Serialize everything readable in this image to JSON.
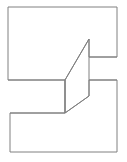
{
  "figure": {
    "canvas": {
      "width": 127,
      "height": 162,
      "background_color": "#ffffff"
    },
    "style": {
      "stroke_color": "#808080",
      "stroke_width": 1,
      "fill_color": "#ffffff"
    },
    "shapes": [
      {
        "name": "block-outline",
        "type": "polygon",
        "label": "Outer silhouette of the stepped block",
        "points": "8,7 117,7 117,57 89,57 89,39 65,80 65,113 89,96 89,80 117,80 117,152 10,152 10,113 65,113 65,80 8,80"
      }
    ],
    "edges": [
      {
        "name": "upper-slant-edge",
        "type": "line",
        "label": "Slanted edge rising from the upper-left face to the top of the middle face",
        "x1": 65,
        "y1": 80,
        "x2": 89,
        "y2": 39
      },
      {
        "name": "middle-vertical-edge",
        "type": "line",
        "label": "Vertical edge on the left of the slanted middle face",
        "x1": 65,
        "y1": 80,
        "x2": 65,
        "y2": 113
      },
      {
        "name": "middle-right-vertical-edge",
        "type": "line",
        "label": "Vertical edge on the right of the slanted middle face",
        "x1": 89,
        "y1": 39,
        "x2": 89,
        "y2": 96
      },
      {
        "name": "lower-slant-edge",
        "type": "line",
        "label": "Slanted edge descending from the middle face to the lower-left face",
        "x1": 89,
        "y1": 96,
        "x2": 65,
        "y2": 113
      },
      {
        "name": "upper-notch-edge",
        "type": "line",
        "label": "Horizontal notch edge on the upper right side",
        "x1": 89,
        "y1": 57,
        "x2": 117,
        "y2": 57
      },
      {
        "name": "lower-notch-edge",
        "type": "line",
        "label": "Horizontal notch edge on the lower right side",
        "x1": 89,
        "y1": 80,
        "x2": 117,
        "y2": 80
      },
      {
        "name": "upper-face-bottom-edge",
        "type": "line",
        "label": "Bottom edge of the upper rectangular face",
        "x1": 8,
        "y1": 80,
        "x2": 65,
        "y2": 80
      },
      {
        "name": "lower-face-top-edge",
        "type": "line",
        "label": "Top edge of the lower rectangular face",
        "x1": 10,
        "y1": 113,
        "x2": 65,
        "y2": 113
      }
    ]
  }
}
